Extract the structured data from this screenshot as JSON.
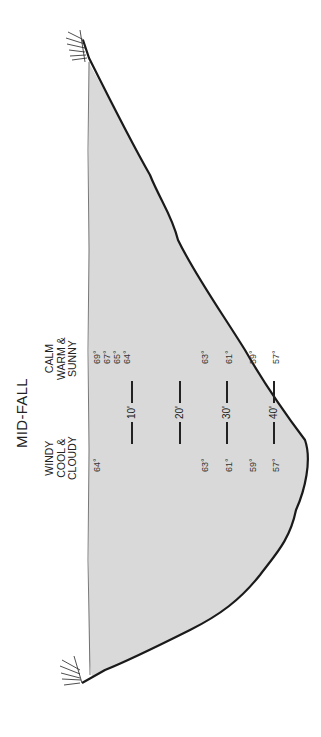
{
  "title": "MID-FALL",
  "conditions": {
    "left": [
      "WINDY",
      "COOL &",
      "CLOUDY"
    ],
    "right": [
      "CALM",
      "WARM &",
      "SUNNY"
    ]
  },
  "depth_markers": [
    "10'",
    "20'",
    "30'",
    "40'"
  ],
  "temperatures": {
    "windy_cool_cloudy": [
      {
        "depth": "surface",
        "value": "64°"
      },
      {
        "depth": "20'",
        "value": "63°"
      },
      {
        "depth": "30'",
        "value": "61°"
      },
      {
        "depth": "35'",
        "value": "59°"
      },
      {
        "depth": "40'",
        "value": "57°"
      }
    ],
    "calm_warm_sunny": [
      {
        "depth": "surface",
        "value": "69°"
      },
      {
        "depth": "surface+",
        "value": "67°"
      },
      {
        "depth": "surface++",
        "value": "65°"
      },
      {
        "depth": "10'",
        "value": "64°"
      },
      {
        "depth": "20'",
        "value": "63°"
      },
      {
        "depth": "30'",
        "value": "61°"
      },
      {
        "depth": "35'",
        "value": "59°"
      },
      {
        "depth": "40'",
        "value": "57°"
      }
    ]
  },
  "colors": {
    "water": "#d9d9d9",
    "outline": "#1a1a1a",
    "background": "#ffffff"
  }
}
